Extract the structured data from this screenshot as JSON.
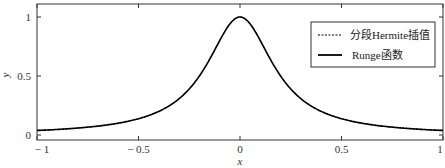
{
  "chart_data": {
    "type": "line",
    "title": "",
    "xlabel": "x",
    "ylabel": "y",
    "xlim": [
      -1,
      1
    ],
    "ylim": [
      -0.03,
      1.1
    ],
    "xticks": [
      -1,
      -0.5,
      0,
      0.5,
      1
    ],
    "xtick_labels": [
      "− 1",
      "− 0.5",
      "0",
      "0.5",
      "1"
    ],
    "yticks": [
      0,
      0.5,
      1
    ],
    "ytick_labels": [
      "0",
      "0.5",
      "1"
    ],
    "grid": false,
    "legend_position": "top-right",
    "series": [
      {
        "name": "分段Hermite插值",
        "style": "dashed",
        "color": "#000000",
        "function": "1/(1+25x^2)",
        "x": [
          -1,
          -0.9,
          -0.8,
          -0.7,
          -0.6,
          -0.5,
          -0.4,
          -0.3,
          -0.2,
          -0.1,
          0,
          0.1,
          0.2,
          0.3,
          0.4,
          0.5,
          0.6,
          0.7,
          0.8,
          0.9,
          1
        ],
        "y": [
          0.0385,
          0.0471,
          0.0588,
          0.0755,
          0.1,
          0.1379,
          0.2,
          0.3077,
          0.5,
          0.8,
          1,
          0.8,
          0.5,
          0.3077,
          0.2,
          0.1379,
          0.1,
          0.0755,
          0.0588,
          0.0471,
          0.0385
        ]
      },
      {
        "name": "Runge函数",
        "style": "solid",
        "color": "#000000",
        "function": "1/(1+25x^2)",
        "x": [
          -1,
          -0.9,
          -0.8,
          -0.7,
          -0.6,
          -0.5,
          -0.4,
          -0.3,
          -0.2,
          -0.1,
          0,
          0.1,
          0.2,
          0.3,
          0.4,
          0.5,
          0.6,
          0.7,
          0.8,
          0.9,
          1
        ],
        "y": [
          0.0385,
          0.0471,
          0.0588,
          0.0755,
          0.1,
          0.1379,
          0.2,
          0.3077,
          0.5,
          0.8,
          1,
          0.8,
          0.5,
          0.3077,
          0.2,
          0.1379,
          0.1,
          0.0755,
          0.0588,
          0.0471,
          0.0385
        ]
      }
    ]
  }
}
